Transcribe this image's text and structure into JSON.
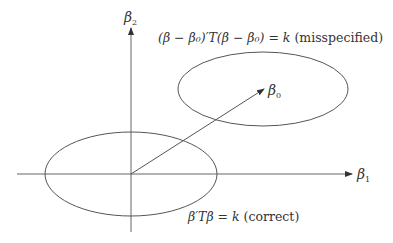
{
  "diagram": {
    "type": "ellipse-contour-diagram",
    "axes": {
      "x_label": "β",
      "x_label_sub": "1",
      "y_label": "β",
      "y_label_sub": "2"
    },
    "point_label": "β",
    "point_label_sub": "0",
    "ellipses": [
      {
        "name": "correct",
        "equation": "β′Tβ = k",
        "note": "(correct)",
        "center": [
          131,
          174
        ],
        "rx": 86,
        "ry": 42
      },
      {
        "name": "misspecified",
        "equation": "(β − β₀)′T(β − β₀) = k",
        "note": "(misspecified)",
        "center": [
          263,
          89
        ],
        "rx": 85,
        "ry": 37
      }
    ],
    "arrow": {
      "from": [
        131,
        174
      ],
      "to": [
        264,
        89
      ]
    },
    "colors": {
      "line": "#555555",
      "text": "#333333",
      "background": "#ffffff"
    }
  }
}
